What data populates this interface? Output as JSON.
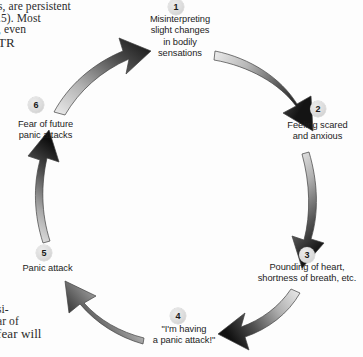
{
  "diagram": {
    "type": "cycle",
    "direction": "clockwise",
    "node_count": 6,
    "nodes": [
      {
        "number": "1",
        "position": "top",
        "lines": [
          "Misinterpreting",
          "slight changes",
          "in bodily",
          "sensations"
        ]
      },
      {
        "number": "2",
        "position": "right",
        "lines": [
          "Feeling scared",
          "and anxious"
        ]
      },
      {
        "number": "3",
        "position": "bottom-right",
        "lines": [
          "Pounding of heart,",
          "shortness of breath, etc."
        ]
      },
      {
        "number": "4",
        "position": "bottom",
        "lines": [
          "\"I'm having",
          "a panic attack!\""
        ]
      },
      {
        "number": "5",
        "position": "bottom-left",
        "lines": [
          "Panic attack"
        ]
      },
      {
        "number": "6",
        "position": "left",
        "lines": [
          "Fear of future",
          "panic attacks"
        ]
      }
    ],
    "arrow_style": {
      "tail_color": "#e8e8e8",
      "head_color": "#151515",
      "outline_color": "#4a4a4a"
    },
    "badge_color": "#d8d8d8"
  },
  "page_text": {
    "top_fragment_lines": [
      "s, are persistent",
      ".5). Most",
      ", even",
      "TR"
    ],
    "bottom_fragment_lines": [
      "si-",
      "ar of",
      "fear will"
    ]
  }
}
